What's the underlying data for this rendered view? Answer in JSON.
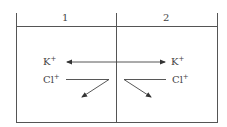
{
  "diagram": {
    "compartments": [
      {
        "label": "1"
      },
      {
        "label": "2"
      }
    ],
    "ions": {
      "left_k": {
        "symbol": "K",
        "charge": "+"
      },
      "right_k": {
        "symbol": "K",
        "charge": "+"
      },
      "left_cl": {
        "symbol": "Cl",
        "charge": "+"
      },
      "right_cl": {
        "symbol": "Cl",
        "charge": "+"
      }
    },
    "colors": {
      "line": "#555555",
      "text": "#444444",
      "background": "#ffffff"
    }
  }
}
